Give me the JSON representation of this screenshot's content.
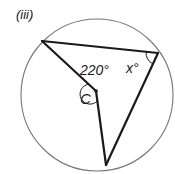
{
  "part_label": "(iii)",
  "circle": {
    "cx": 97,
    "cy": 95,
    "r": 76,
    "stroke": "#777777"
  },
  "center": {
    "label": "C",
    "x": 96,
    "y": 91
  },
  "vertices": {
    "top_left": {
      "x": 42,
      "y": 41
    },
    "right": {
      "x": 158,
      "y": 53
    },
    "bottom": {
      "x": 106,
      "y": 165
    }
  },
  "angles": {
    "reflex_at_center": {
      "value": "220°"
    },
    "inscribed_at_right": {
      "value": "x°"
    }
  },
  "colors": {
    "line": "#1a1a1a",
    "circle": "#777777"
  }
}
